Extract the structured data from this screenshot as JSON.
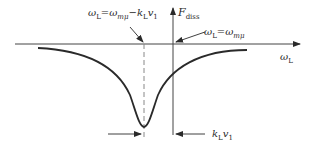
{
  "diagram": {
    "type": "resonance-dip",
    "axes": {
      "x_label": "ω",
      "x_label_sub": "L",
      "y_label": "F",
      "y_label_sub": "diss"
    },
    "annotations": {
      "shifted_resonance": {
        "prefix": "ω",
        "prefix_sub": "L",
        "eq": "=ω",
        "eq_sub": "mμ",
        "minus": "−k",
        "minus_sub": "L",
        "tail": "v",
        "tail_sub": "1"
      },
      "resonance": {
        "prefix": "ω",
        "prefix_sub": "L",
        "eq": "=ω",
        "eq_sub": "mμ"
      },
      "shift": {
        "k": "k",
        "k_sub": "L",
        "v": "v",
        "v_sub": "1"
      }
    },
    "colors": {
      "stroke": "#2a2a2a",
      "dashed": "#888888",
      "background": "#ffffff"
    }
  }
}
